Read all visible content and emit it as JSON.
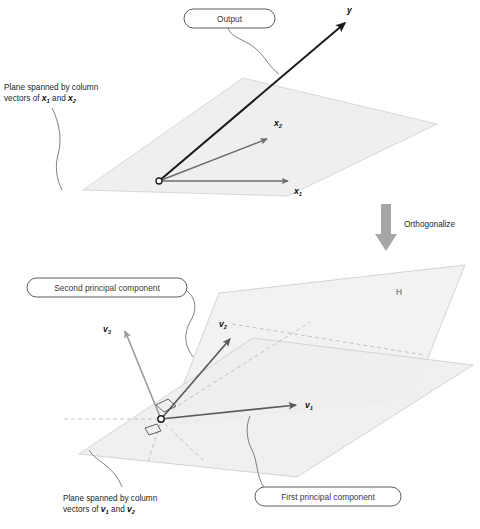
{
  "figure": {
    "panels": {
      "top": {
        "plane_label": "Plane spanned by column\nvectors of x₁ and x₂",
        "plane_label_line1": "Plane spanned by column",
        "plane_label_line2_pre": "vectors of ",
        "plane_label_v1": "x",
        "plane_label_sub1": "1",
        "plane_label_mid": " and ",
        "plane_label_v2": "x",
        "plane_label_sub2": "2",
        "callout_output": "Output",
        "vectors": [
          {
            "name": "y",
            "label": "y",
            "subscript": "",
            "color": "#1a1a1a"
          },
          {
            "name": "x2",
            "label": "x",
            "subscript": "2",
            "color": "#6d6d6d"
          },
          {
            "name": "x1",
            "label": "x",
            "subscript": "1",
            "color": "#6d6d6d"
          }
        ],
        "origin_label": "origin"
      },
      "transition": {
        "arrow_label": "Orthogonalize",
        "arrow_color": "#a6a6a6"
      },
      "bottom": {
        "callout_second": "Second principal component",
        "callout_first": "First principal component",
        "plane_label_line1": "Plane spanned by column",
        "plane_label_line2_pre": "vectors of ",
        "plane_label_v1": "v",
        "plane_label_sub1": "1",
        "plane_label_mid": " and ",
        "plane_label_v2": "v",
        "plane_label_sub2": "2",
        "hyperplane_label": "H",
        "vectors": [
          {
            "name": "v3",
            "label": "v",
            "subscript": "3",
            "color": "#9a9a9a"
          },
          {
            "name": "v2",
            "label": "v",
            "subscript": "2",
            "color": "#5a5a5a"
          },
          {
            "name": "v1",
            "label": "v",
            "subscript": "1",
            "color": "#5a5a5a"
          }
        ]
      }
    },
    "colors": {
      "plane_fill": "#efefef",
      "plane_stroke": "#c9c9c9",
      "callout_stroke": "#4a4a4a",
      "vector_dark": "#1a1a1a",
      "vector_gray": "#6d6d6d",
      "vector_light": "#9a9a9a",
      "dashed": "#b5b5b5",
      "text": "#231f20"
    }
  }
}
